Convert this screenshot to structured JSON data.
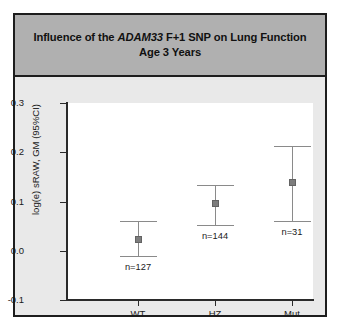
{
  "figure": {
    "title_prefix": "Influence of the ",
    "title_gene": "ADAM33",
    "title_suffix": " F+1 SNP on Lung Function Age 3 Years"
  },
  "chart_data": {
    "type": "scatter",
    "title": "Influence of the ADAM33 F+1 SNP on Lung Function Age 3 Years",
    "xlabel": "",
    "ylabel": "log(e) sRAW, GM (95%CI)",
    "categories": [
      "WT",
      "HZ",
      "Mut"
    ],
    "values": [
      0.022,
      0.095,
      0.138
    ],
    "ci_lower": [
      -0.01,
      0.052,
      0.06
    ],
    "ci_upper": [
      0.06,
      0.134,
      0.212
    ],
    "n_labels": [
      "n=127",
      "n=144",
      "n=31"
    ],
    "counts": [
      127,
      144,
      31
    ],
    "ylim": [
      -0.1,
      0.3
    ],
    "yticks": [
      0.3,
      0.2,
      0.1,
      0.0,
      -0.1
    ],
    "ytick_labels": [
      "0.3",
      "0.2",
      "0.1",
      "0.0",
      "-0.1"
    ],
    "grid": false,
    "legend": null,
    "marker_color": "#7d7d7d",
    "errorbar_color": "#8a8a8a"
  }
}
